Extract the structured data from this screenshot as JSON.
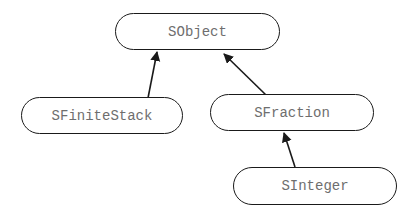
{
  "diagram": {
    "type": "class-hierarchy",
    "nodes": [
      {
        "id": "SObject",
        "label": "SObject"
      },
      {
        "id": "SFiniteStack",
        "label": "SFiniteStack"
      },
      {
        "id": "SFraction",
        "label": "SFraction"
      },
      {
        "id": "SInteger",
        "label": "SInteger"
      }
    ],
    "edges": [
      {
        "from": "SFiniteStack",
        "to": "SObject",
        "type": "inheritance"
      },
      {
        "from": "SFraction",
        "to": "SObject",
        "type": "inheritance"
      },
      {
        "from": "SInteger",
        "to": "SFraction",
        "type": "inheritance"
      }
    ],
    "colors": {
      "line": "#1a1a1a",
      "text": "#6e6e6e",
      "background": "#ffffff"
    }
  }
}
